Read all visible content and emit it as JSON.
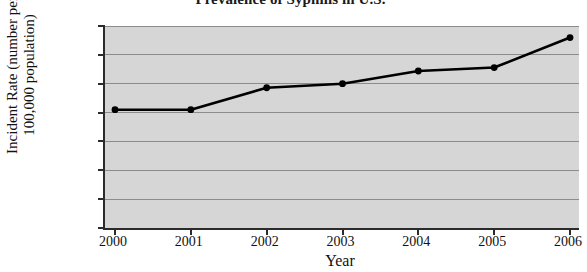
{
  "chart_data": {
    "type": "line",
    "title": "Prevalence of Syphilis in U.S.",
    "xlabel": "Year",
    "ylabel_line1": "Incident Rate (number per",
    "ylabel_line2": "100,000 population)",
    "ylabel": "Incident Rate (number per 100,000 population)",
    "categories": [
      "2000",
      "2001",
      "2002",
      "2003",
      "2004",
      "2005",
      "2006"
    ],
    "x": [
      2000,
      2001,
      2002,
      2003,
      2004,
      2005,
      2006
    ],
    "values": [
      2.05,
      2.05,
      2.43,
      2.5,
      2.72,
      2.78,
      3.3
    ],
    "series": [
      {
        "name": "Incident Rate",
        "values": [
          2.05,
          2.05,
          2.43,
          2.5,
          2.72,
          2.78,
          3.3
        ]
      }
    ],
    "ylim": [
      0,
      3.5
    ],
    "yticks": [
      0,
      0.5,
      1,
      1.5,
      2,
      2.5,
      3,
      3.5
    ],
    "ytick_labels": [
      "0",
      "0.5",
      "1",
      "1.5",
      "2",
      "2.5",
      "3",
      "3.5"
    ],
    "grid": true,
    "legend": false,
    "marker": "circle",
    "line_color": "#000000",
    "marker_color": "#000000",
    "plot_background": "#d6d6d6",
    "gridline_color": "#8c8c8c",
    "axis_color": "#2b2b2b",
    "figure_background": "#ffffff"
  }
}
